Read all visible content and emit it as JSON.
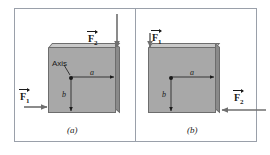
{
  "figure": {
    "type": "physics-free-body-diagram",
    "panels": [
      {
        "id": "a",
        "caption": "(a)",
        "axis_label": "Axis",
        "dimension_horizontal": "a",
        "dimension_vertical": "b",
        "forces": [
          {
            "name": "F1",
            "label_base": "F",
            "label_sub": "1",
            "direction": "right",
            "applied_at": "lower-left-edge-outside",
            "vector_notation": true
          },
          {
            "name": "F2",
            "label_base": "F",
            "label_sub": "2",
            "direction": "down",
            "applied_at": "top-right-corner",
            "vector_notation": true
          }
        ]
      },
      {
        "id": "b",
        "caption": "(b)",
        "axis_label": "",
        "dimension_horizontal": "a",
        "dimension_vertical": "b",
        "forces": [
          {
            "name": "F1",
            "label_base": "F",
            "label_sub": "1",
            "direction": "down",
            "applied_at": "top-left-corner",
            "vector_notation": true
          },
          {
            "name": "F2",
            "label_base": "F",
            "label_sub": "2",
            "direction": "left",
            "applied_at": "lower-right-edge-outside",
            "vector_notation": true
          }
        ]
      }
    ],
    "colors": {
      "block_fill": "#a8a8a8",
      "block_top_edge": "#c9c9c9",
      "block_right_edge": "#8a8a8a",
      "block_outline": "#6d6d6d",
      "frame_border": "#9aa0aa",
      "arrow": "#6f6f6f",
      "dimension_arrow": "#1a1a1a",
      "text": "#1a1a1a",
      "background": "#ffffff"
    }
  }
}
